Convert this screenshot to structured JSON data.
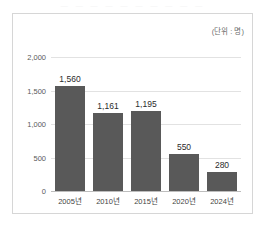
{
  "top_strip": {
    "text": "— — — — — — — — — —"
  },
  "chart_data": {
    "type": "bar",
    "title": "",
    "subtitle": "",
    "unit_label": "(단위 : 명)",
    "xlabel": "",
    "ylabel": "",
    "categories": [
      "2005년",
      "2010년",
      "2015년",
      "2020년",
      "2024년"
    ],
    "values": [
      1560,
      1161,
      1195,
      550,
      280
    ],
    "value_labels": [
      "1,560",
      "1,161",
      "1,195",
      "550",
      "280"
    ],
    "ylim": [
      0,
      2000
    ],
    "yticks": [
      0,
      500,
      1000,
      1500,
      2000
    ],
    "ytick_labels": [
      "0",
      "500",
      "1,000",
      "1,500",
      "2,000"
    ],
    "grid": true,
    "legend": "none",
    "bar_color": "#595959",
    "grid_color": "#e2e2e2",
    "axis_color": "#bdbdbd",
    "frame_color": "#d6d6d6",
    "background": "#ffffff"
  }
}
